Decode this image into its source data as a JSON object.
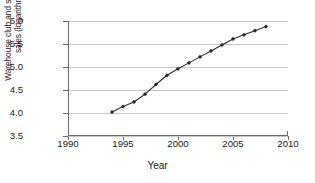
{
  "chart_data": {
    "type": "line",
    "title": "",
    "xlabel": "Year",
    "ylabel": "Warehouse club and superstore sales (logarithm)",
    "ylabel_line1": "Warehouse club and superstore",
    "ylabel_line2": "sales (logarithm)",
    "xlim": [
      1990,
      2010
    ],
    "ylim": [
      3.5,
      6.0
    ],
    "xticks": [
      "1990",
      "1995",
      "2000",
      "2005",
      "2010"
    ],
    "xtick_values": [
      1990,
      1995,
      2000,
      2005,
      2010
    ],
    "yticks": [
      "3.5",
      "4.0",
      "4.5",
      "5.0",
      "5.5",
      "6.0"
    ],
    "ytick_values": [
      3.5,
      4.0,
      4.5,
      5.0,
      5.5,
      6.0
    ],
    "grid": "horizontal",
    "legend": "none",
    "marker": "filled-diamond",
    "line_color": "#2b2b2b",
    "grid_color": "#c9c9c9",
    "axis_color": "#6b6b6b",
    "series": [
      {
        "name": "Warehouse club and superstore sales (logarithm)",
        "x": [
          1994,
          1995,
          1996,
          1997,
          1998,
          1999,
          2000,
          2001,
          2002,
          2003,
          2004,
          2005,
          2006,
          2007,
          2008
        ],
        "values": [
          4.02,
          4.14,
          4.24,
          4.41,
          4.62,
          4.82,
          4.96,
          5.09,
          5.22,
          5.35,
          5.48,
          5.61,
          5.7,
          5.79,
          5.88
        ]
      }
    ]
  }
}
